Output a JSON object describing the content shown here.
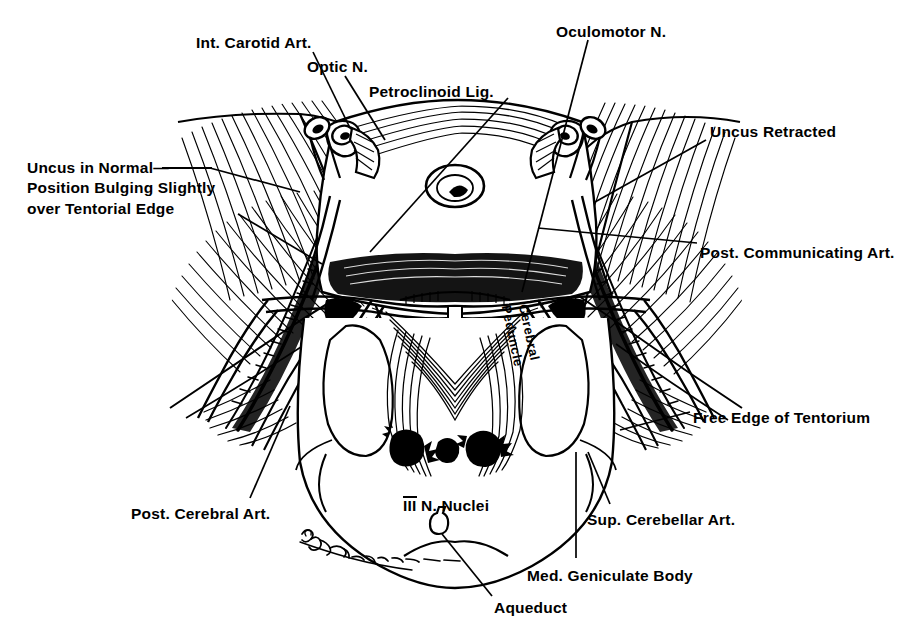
{
  "figure": {
    "kind": "anatomical-line-drawing",
    "background_color": "#ffffff",
    "ink_color": "#000000",
    "width": 910,
    "height": 639,
    "signature": "handwritten artist signature (cursive, illegible)"
  },
  "labels": [
    {
      "id": "int-carotid-art",
      "text": "Int. Carotid Art.",
      "x": 196,
      "y": 33,
      "align": "left",
      "leader": [
        [
          313,
          52
        ],
        [
          350,
          128
        ]
      ]
    },
    {
      "id": "optic-n",
      "text": "Optic N.",
      "x": 307,
      "y": 57,
      "align": "left",
      "leader": [
        [
          345,
          76
        ],
        [
          385,
          140
        ]
      ]
    },
    {
      "id": "petroclinoid-lig",
      "text": "Petroclinoid Lig.",
      "x": 369,
      "y": 82,
      "align": "left",
      "leader": [
        [
          408,
          98
        ],
        [
          370,
          250
        ]
      ]
    },
    {
      "id": "oculomotor-n",
      "text": "Oculomotor N.",
      "x": 556,
      "y": 22,
      "align": "left",
      "leader": [
        [
          588,
          40
        ],
        [
          520,
          290
        ]
      ]
    },
    {
      "id": "uncus-retracted",
      "text": "Uncus Retracted",
      "x": 710,
      "y": 122,
      "align": "left",
      "leader": [
        [
          706,
          140
        ],
        [
          595,
          200
        ]
      ]
    },
    {
      "id": "post-communicating-art",
      "text": "Post. Communicating Art.",
      "x": 700,
      "y": 243,
      "align": "left",
      "leader": [
        [
          697,
          245
        ],
        [
          540,
          230
        ]
      ]
    },
    {
      "id": "uncus-normal-position",
      "text": "Uncus in Normal—\nPosition Bulging Slightly\nover Tentorial Edge",
      "x": 27,
      "y": 158,
      "align": "left",
      "leader": [
        [
          255,
          168
        ],
        [
          300,
          190
        ]
      ],
      "leader2": [
        [
          240,
          214
        ],
        [
          320,
          262
        ]
      ]
    },
    {
      "id": "post-cerebral-art",
      "text": "Post. Cerebral Art.",
      "x": 131,
      "y": 504,
      "align": "left",
      "leader": [
        [
          248,
          500
        ],
        [
          288,
          408
        ]
      ]
    },
    {
      "id": "cerebral-peduncle",
      "text": "Cerebral\nPeduncle",
      "x": 531,
      "y": 300,
      "align": "left",
      "rotate": 78
    },
    {
      "id": "iii-n-nuclei",
      "prefix": "III",
      "text": " N. Nuclei",
      "x": 385,
      "y": 476,
      "align": "left"
    },
    {
      "id": "free-edge-of-tentorium",
      "text": "Free Edge of Tentorium",
      "x": 693,
      "y": 408,
      "align": "left",
      "leader": [
        [
          690,
          414
        ],
        [
          622,
          432
        ]
      ]
    },
    {
      "id": "sup-cerebellar-art",
      "text": "Sup. Cerebellar Art.",
      "x": 587,
      "y": 510,
      "align": "left",
      "leader": [
        [
          608,
          506
        ],
        [
          588,
          452
        ]
      ]
    },
    {
      "id": "med-geniculate-body",
      "text": "Med. Geniculate Body",
      "x": 527,
      "y": 566,
      "align": "left",
      "leader": [
        [
          575,
          560
        ],
        [
          575,
          452
        ]
      ]
    },
    {
      "id": "aqueduct",
      "text": "Aqueduct",
      "x": 494,
      "y": 598,
      "align": "left",
      "leader": [
        [
          492,
          598
        ],
        [
          442,
          532
        ]
      ]
    }
  ]
}
